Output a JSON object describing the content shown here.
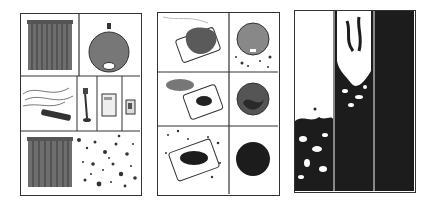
{
  "figure": {
    "panels": [
      {
        "id": "panel-1",
        "subject": "sources of particles",
        "cells": [
          "curtain",
          "round-speaker-object",
          "tangled-power-strip",
          "desk-lamp",
          "computer-tower",
          "small-appliance",
          "curtain-emitting-particles"
        ]
      },
      {
        "id": "panel-2",
        "subject": "dust accumulating on device",
        "cells": [
          "dust-clump-on-phone",
          "circle-with-scattered-particles",
          "smaller-dust-on-phone",
          "circle-darkening",
          "phone-covered-dark",
          "solid-dark-circle"
        ]
      },
      {
        "id": "panel-3",
        "subject": "progressive fill stages",
        "columns": [
          "mostly-white-bottom-particles",
          "half-filled",
          "fully-dark"
        ]
      }
    ],
    "colors": {
      "ink": "#222222",
      "mid": "#6a6a6a",
      "dark_fill": "#1c1c1c",
      "border": "#333333",
      "background": "#ffffff"
    }
  }
}
